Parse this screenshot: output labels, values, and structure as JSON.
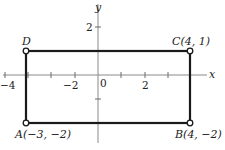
{
  "figure": {
    "type": "coordinate-plane-rectangle",
    "axes": {
      "x_label": "x",
      "y_label": "y",
      "origin_label": "0",
      "x_tick_labels": [
        {
          "value": -4,
          "text": "−4"
        },
        {
          "value": -2,
          "text": "−2"
        },
        {
          "value": 2,
          "text": "2"
        }
      ],
      "y_tick_labels": [
        {
          "value": 2,
          "text": "2"
        }
      ],
      "x_ticks": [
        -4,
        -3,
        -2,
        -1,
        1,
        2,
        3
      ],
      "y_ticks": [
        2,
        -1
      ]
    },
    "vertices": [
      {
        "name": "A",
        "label": "A(−3, −2)",
        "x": -3,
        "y": -2
      },
      {
        "name": "B",
        "label": "B(4, −2)",
        "x": 4,
        "y": -2
      },
      {
        "name": "C",
        "label": "C(4, 1)",
        "x": 4,
        "y": 1
      },
      {
        "name": "D",
        "label": "D",
        "x": -3,
        "y": 1
      }
    ],
    "colors": {
      "rectangle": "#1a1a1a",
      "axes": "#8a8a8a",
      "background": "#ffffff"
    }
  }
}
